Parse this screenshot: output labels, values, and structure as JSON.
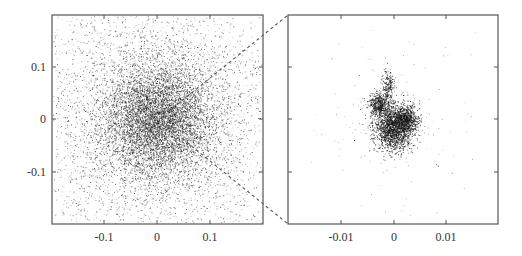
{
  "chart_data": [
    {
      "type": "scatter",
      "panel": "left",
      "title": "",
      "xlabel": "",
      "ylabel": "",
      "xlim": [
        -0.2,
        0.2
      ],
      "ylim": [
        -0.2,
        0.2
      ],
      "grid": false,
      "legend": null,
      "x_ticks": [
        "-0.1",
        "0",
        "0.1"
      ],
      "y_ticks": [
        "0.1",
        "0",
        "-0.1"
      ],
      "x_tick_values": [
        -0.1,
        0,
        0.1
      ],
      "y_tick_values": [
        0.1,
        0,
        -0.1
      ],
      "description": "Dense isotropic point cloud centered at (0,0), roughly Gaussian with std ~0.05, points spread across full range",
      "distribution": {
        "center": [
          0,
          0
        ],
        "std": 0.055,
        "n_points": 9000
      },
      "point_color": "#222222"
    },
    {
      "type": "scatter",
      "panel": "right",
      "title": "",
      "xlabel": "",
      "ylabel": "",
      "xlim": [
        -0.02,
        0.02
      ],
      "ylim": [
        -0.02,
        0.02
      ],
      "grid": false,
      "legend": null,
      "x_ticks": [
        "-0.01",
        "0",
        "0.01"
      ],
      "y_ticks": [],
      "x_tick_values": [
        -0.01,
        0,
        0.01
      ],
      "y_tick_values": [
        0.01,
        0,
        -0.01
      ],
      "description": "Zoomed view of the central region: compact irregular dark cluster near origin with a small vertical protrusion above, sparse scattered points elsewhere",
      "clusters": [
        {
          "center": [
            0.0,
            -0.0015
          ],
          "std": [
            0.0018,
            0.0022
          ],
          "n_points": 1800
        },
        {
          "center": [
            0.0025,
            0.0
          ],
          "std": [
            0.0012,
            0.0013
          ],
          "n_points": 700
        },
        {
          "center": [
            -0.0028,
            0.0028
          ],
          "std": [
            0.0009,
            0.0012
          ],
          "n_points": 500
        },
        {
          "center": [
            -0.001,
            0.0065
          ],
          "std": [
            0.0006,
            0.0014
          ],
          "n_points": 200
        },
        {
          "center": [
            0.0,
            0.0
          ],
          "std": [
            0.007,
            0.007
          ],
          "n_points": 160
        }
      ],
      "point_color": "#1a1a1a"
    }
  ],
  "zoom_indicator": {
    "style": "dashed",
    "from_panel": "left",
    "to_panel": "right",
    "color": "#555555"
  }
}
